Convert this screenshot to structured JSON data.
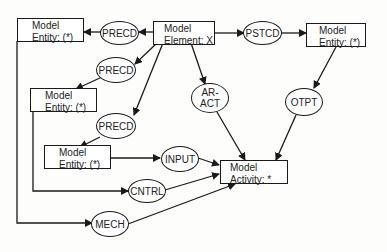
{
  "diagram": {
    "boxes": {
      "element": {
        "line1": "Model",
        "line2": "Element: X"
      },
      "entity_tl": {
        "line1": "Model",
        "line2": "Entity: (*)"
      },
      "entity_mid": {
        "line1": "Model",
        "line2": "Entity: (*)"
      },
      "entity_low": {
        "line1": "Model",
        "line2": "Entity: (*)"
      },
      "entity_tr": {
        "line1": "Model",
        "line2": "Entity: (*)"
      },
      "activity": {
        "line1": "Model",
        "line2": "Activity:  *"
      }
    },
    "relations": {
      "precd_top": "PRECD",
      "precd_mid": "PRECD",
      "precd_low": "PRECD",
      "pstcd": "PSTCD",
      "ar_act": "AR-\nACT",
      "otpt": "OTPT",
      "input": "INPUT",
      "cntrl": "CNTRL",
      "mech": "MECH"
    },
    "colors": {
      "line": "#1a1a1a",
      "background": "#fdfdfc"
    }
  }
}
